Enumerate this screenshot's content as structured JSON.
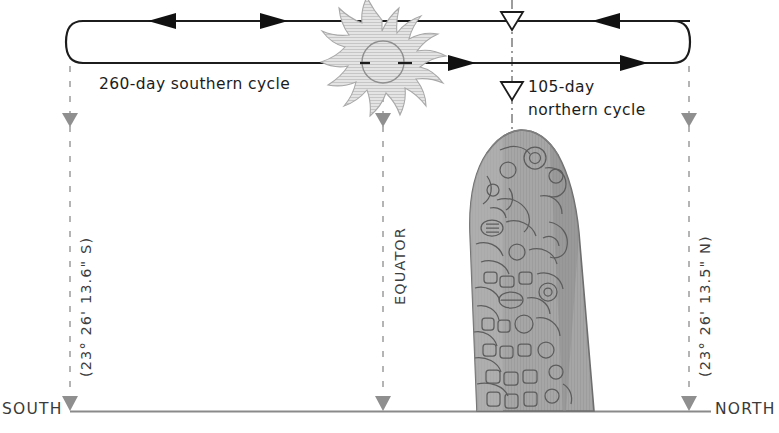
{
  "diagram": {
    "cycles": {
      "southern": {
        "label": "260-day southern cycle",
        "days": 260,
        "direction": "southward-loop"
      },
      "northern": {
        "label": "105-day northern cycle",
        "days": 105,
        "direction": "northward-loop"
      }
    },
    "axis": {
      "south_label": "SOUTH",
      "north_label": "NORTH",
      "equator_label": "EQUATOR"
    },
    "tropics": {
      "south": {
        "label": "(23° 26' 13.6\" S)",
        "degrees": 23,
        "minutes": 26,
        "seconds": 13.6,
        "hemisphere": "S"
      },
      "north": {
        "label": "(23° 26' 13.5\" N)",
        "degrees": 23,
        "minutes": 26,
        "seconds": 13.5,
        "hemisphere": "N"
      }
    },
    "icons": {
      "sun": "sun-icon",
      "stela": "maya-stela-icon",
      "marker_down": "down-triangle-marker-icon",
      "equator_marker": "hollow-down-triangle-icon",
      "arrow_left": "arrow-left-icon",
      "arrow_right": "arrow-right-icon"
    },
    "colors": {
      "line": "#1c1c1c",
      "guide": "#9a9a9a",
      "marker": "#8f8f8f",
      "baseline": "#8a8a8a",
      "stela_fill": "#9d9d9d",
      "stela_edge": "#6a6a6a",
      "sun_fill": "#d9d9d9",
      "sun_edge": "#9e9e9e",
      "text": "#2b2b2b"
    }
  }
}
